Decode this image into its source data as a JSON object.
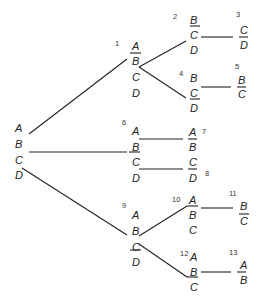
{
  "diagram": {
    "type": "tree",
    "line_color": "#222222",
    "root": {
      "id": "root",
      "items": [
        "A",
        "B",
        "C",
        "D"
      ]
    },
    "nodes": [
      {
        "id": "1",
        "label": "1",
        "items": [
          "A",
          "B",
          "C",
          "D"
        ]
      },
      {
        "id": "2",
        "label": "2",
        "items": [
          "B",
          "C",
          "D"
        ]
      },
      {
        "id": "3",
        "label": "3",
        "items": [
          "C",
          "D"
        ]
      },
      {
        "id": "4",
        "label": "4",
        "items": [
          "B",
          "C",
          "D"
        ]
      },
      {
        "id": "5",
        "label": "5",
        "items": [
          "B",
          "C"
        ]
      },
      {
        "id": "6",
        "label": "6",
        "items": [
          "A",
          "B",
          "C",
          "D"
        ]
      },
      {
        "id": "7",
        "label": "7",
        "items": [
          "A",
          "B"
        ]
      },
      {
        "id": "8",
        "label": "8",
        "items": [
          "C",
          "D"
        ]
      },
      {
        "id": "9",
        "label": "9",
        "items": [
          "A",
          "B",
          "C",
          "D"
        ]
      },
      {
        "id": "10",
        "label": "10",
        "items": [
          "A",
          "B",
          "C"
        ]
      },
      {
        "id": "11",
        "label": "11",
        "items": [
          "B",
          "C"
        ]
      },
      {
        "id": "12",
        "label": "12",
        "items": [
          "A",
          "B",
          "C"
        ]
      },
      {
        "id": "13",
        "label": "13",
        "items": [
          "A",
          "B"
        ]
      }
    ],
    "edges": [
      [
        "root",
        "1"
      ],
      [
        "root",
        "6"
      ],
      [
        "root",
        "9"
      ],
      [
        "1",
        "2"
      ],
      [
        "1",
        "4"
      ],
      [
        "2",
        "3"
      ],
      [
        "4",
        "5"
      ],
      [
        "6",
        "7"
      ],
      [
        "6",
        "8"
      ],
      [
        "9",
        "10"
      ],
      [
        "9",
        "12"
      ],
      [
        "10",
        "11"
      ],
      [
        "12",
        "13"
      ]
    ]
  }
}
